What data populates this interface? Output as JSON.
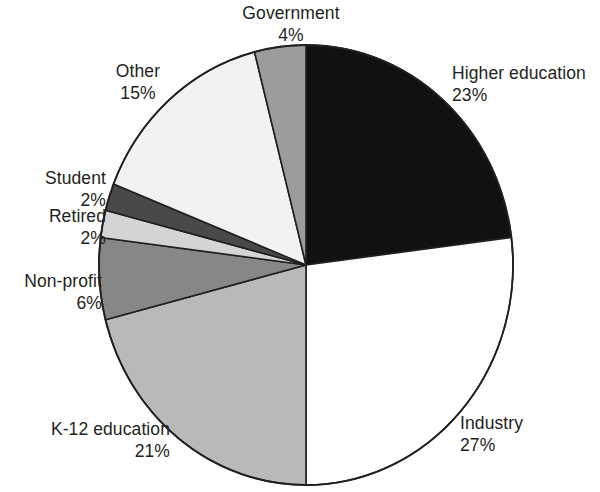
{
  "chart_data": {
    "type": "pie",
    "title": "",
    "subtitle": "",
    "xlabel": "",
    "ylabel": "",
    "legend_position": "none",
    "grid": false,
    "value_unit": "%",
    "start_angle_deg": 0,
    "direction": "clockwise",
    "total": 100,
    "categories": [
      "Higher education",
      "Industry",
      "K-12 education",
      "Non-profit",
      "Retired",
      "Student",
      "Other",
      "Government"
    ],
    "values": [
      23,
      27,
      21,
      6,
      2,
      2,
      15,
      4
    ],
    "slices": [
      {
        "label": "Higher education",
        "value": 23,
        "value_text": "23%",
        "color": "#111111",
        "start_pct": 0,
        "end_pct": 23
      },
      {
        "label": "Industry",
        "value": 27,
        "value_text": "27%",
        "color": "#ffffff",
        "start_pct": 23,
        "end_pct": 50
      },
      {
        "label": "K-12 education",
        "value": 21,
        "value_text": "21%",
        "color": "#b9b9b9",
        "start_pct": 50,
        "end_pct": 71
      },
      {
        "label": "Non-profit",
        "value": 6,
        "value_text": "6%",
        "color": "#878787",
        "start_pct": 71,
        "end_pct": 77
      },
      {
        "label": "Retired",
        "value": 2,
        "value_text": "2%",
        "color": "#d4d4d4",
        "start_pct": 77,
        "end_pct": 79
      },
      {
        "label": "Student",
        "value": 2,
        "value_text": "2%",
        "color": "#494949",
        "start_pct": 79,
        "end_pct": 81
      },
      {
        "label": "Other",
        "value": 15,
        "value_text": "15%",
        "color": "#f2f2f2",
        "start_pct": 81,
        "end_pct": 96
      },
      {
        "label": "Government",
        "value": 4,
        "value_text": "4%",
        "color": "#9c9c9c",
        "start_pct": 96,
        "end_pct": 100
      }
    ],
    "stroke_color": "#231f20",
    "text_color": "#231f20",
    "background": "#ffffff"
  },
  "labels": {
    "government": {
      "name": "Government",
      "value": "4%"
    },
    "higher_ed": {
      "name": "Higher education",
      "value": "23%"
    },
    "other": {
      "name": "Other",
      "value": "15%"
    },
    "student": {
      "name": "Student",
      "value": "2%"
    },
    "retired": {
      "name": "Retired",
      "value": "2%"
    },
    "nonprofit": {
      "name": "Non-profit",
      "value": "6%"
    },
    "k12": {
      "name": "K-12 education",
      "value": "21%"
    },
    "industry": {
      "name": "Industry",
      "value": "27%"
    }
  }
}
